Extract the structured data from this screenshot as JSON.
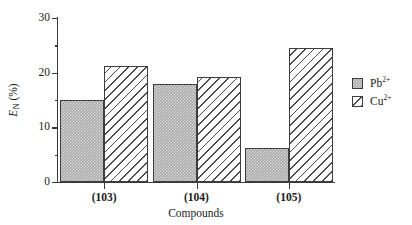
{
  "chart_data": {
    "type": "bar",
    "title": "",
    "xlabel": "Compounds",
    "ylabel": "E_N (%)",
    "ylabel_base": "E",
    "ylabel_sub": "N",
    "ylabel_unit": " (%)",
    "categories": [
      "(103)",
      "(104)",
      "(105)"
    ],
    "series": [
      {
        "name": "Pb2+",
        "name_base": "Pb",
        "name_sup": "2+",
        "values": [
          15.0,
          18.0,
          6.2
        ],
        "fill": "stipple-gray",
        "color": "#a8a8a8"
      },
      {
        "name": "Cu2+",
        "name_base": "Cu",
        "name_sup": "2+",
        "values": [
          21.2,
          19.3,
          24.5
        ],
        "fill": "diagonal-hatch",
        "color": "#ffffff"
      }
    ],
    "ylim": [
      0,
      30
    ],
    "y_major_ticks": [
      0,
      10,
      20,
      30
    ],
    "y_minor_ticks": [
      5,
      15,
      25
    ],
    "y_tick_labels": [
      "0",
      "10",
      "20",
      "30"
    ],
    "grid": false,
    "legend_position": "right",
    "axis_color": "#3a3a3a"
  },
  "legend": {
    "entries": [
      {
        "label_base": "Pb",
        "label_sup": "2+"
      },
      {
        "label_base": "Cu",
        "label_sup": "2+"
      }
    ]
  }
}
